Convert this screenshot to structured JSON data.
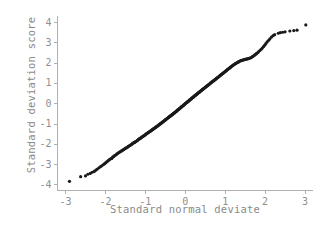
{
  "chart_data": {
    "type": "scatter",
    "title": "",
    "xlabel": "Standard normal deviate",
    "ylabel": "Standard deviation score",
    "xlim": [
      -3.2,
      3.2
    ],
    "ylim": [
      -4.3,
      4.3
    ],
    "xticks": [
      -3,
      -2,
      -1,
      0,
      1,
      2,
      3
    ],
    "xticklabels": [
      "-3",
      "-2",
      "-1",
      "0",
      "1",
      "2",
      "3"
    ],
    "yticks": [
      -4,
      -3,
      -2,
      -1,
      0,
      1,
      2,
      3,
      4
    ],
    "yticklabels": [
      "-4",
      "-3",
      "-2",
      "-1",
      "0",
      "1",
      "2",
      "3",
      "4"
    ],
    "grid": false,
    "legend": null,
    "marker": "point",
    "marker_color": "#1a1a1a",
    "marker_size": 1.6,
    "axis_color": "#b0b0b0",
    "text_color": "#8a8a8a",
    "background": "#ffffff",
    "spines": [
      "left",
      "bottom"
    ],
    "series": [
      {
        "name": "sd score vs normal deviate",
        "x": [
          -2.9,
          -2.62,
          -2.5,
          -2.44,
          -2.38,
          -2.33,
          -2.28,
          -2.24,
          -2.2,
          -2.16,
          -2.12,
          -2.09,
          -2.05,
          -2.02,
          -1.99,
          -1.96,
          -1.93,
          -1.9,
          -1.87,
          -1.84,
          -1.82,
          -1.79,
          -1.77,
          -1.74,
          -1.72,
          -1.69,
          -1.67,
          -1.65,
          -1.62,
          -1.6,
          -1.58,
          -1.56,
          -1.54,
          -1.52,
          -1.5,
          -1.48,
          -1.46,
          -1.44,
          -1.42,
          -1.4,
          -1.38,
          -1.36,
          -1.34,
          -1.33,
          -1.31,
          -1.29,
          -1.27,
          -1.26,
          -1.24,
          -1.22,
          -1.2,
          -1.19,
          -1.17,
          -1.15,
          -1.14,
          -1.12,
          -1.11,
          -1.09,
          -1.07,
          -1.06,
          -1.04,
          -1.03,
          -1.01,
          -1.0,
          -0.98,
          -0.97,
          -0.95,
          -0.94,
          -0.92,
          -0.91,
          -0.89,
          -0.88,
          -0.86,
          -0.85,
          -0.84,
          -0.82,
          -0.81,
          -0.79,
          -0.78,
          -0.77,
          -0.75,
          -0.74,
          -0.72,
          -0.71,
          -0.7,
          -0.68,
          -0.67,
          -0.66,
          -0.64,
          -0.63,
          -0.62,
          -0.6,
          -0.59,
          -0.58,
          -0.56,
          -0.55,
          -0.54,
          -0.52,
          -0.51,
          -0.5,
          -0.49,
          -0.47,
          -0.46,
          -0.45,
          -0.43,
          -0.42,
          -0.41,
          -0.4,
          -0.38,
          -0.37,
          -0.36,
          -0.35,
          -0.33,
          -0.32,
          -0.31,
          -0.3,
          -0.28,
          -0.27,
          -0.26,
          -0.25,
          -0.23,
          -0.22,
          -0.21,
          -0.2,
          -0.19,
          -0.17,
          -0.16,
          -0.15,
          -0.14,
          -0.12,
          -0.11,
          -0.1,
          -0.09,
          -0.08,
          -0.06,
          -0.05,
          -0.04,
          -0.03,
          -0.01,
          0.0,
          0.01,
          0.03,
          0.04,
          0.05,
          0.06,
          0.08,
          0.09,
          0.1,
          0.11,
          0.12,
          0.14,
          0.15,
          0.16,
          0.17,
          0.19,
          0.2,
          0.21,
          0.22,
          0.23,
          0.25,
          0.26,
          0.27,
          0.28,
          0.3,
          0.31,
          0.32,
          0.33,
          0.35,
          0.36,
          0.37,
          0.38,
          0.4,
          0.41,
          0.42,
          0.43,
          0.45,
          0.46,
          0.47,
          0.49,
          0.5,
          0.51,
          0.52,
          0.54,
          0.55,
          0.56,
          0.58,
          0.59,
          0.6,
          0.62,
          0.63,
          0.64,
          0.66,
          0.67,
          0.68,
          0.7,
          0.71,
          0.72,
          0.74,
          0.75,
          0.77,
          0.78,
          0.79,
          0.81,
          0.82,
          0.84,
          0.85,
          0.86,
          0.88,
          0.89,
          0.91,
          0.92,
          0.94,
          0.95,
          0.97,
          0.98,
          1.0,
          1.01,
          1.03,
          1.04,
          1.06,
          1.07,
          1.09,
          1.11,
          1.12,
          1.14,
          1.15,
          1.17,
          1.19,
          1.2,
          1.22,
          1.24,
          1.26,
          1.27,
          1.29,
          1.31,
          1.33,
          1.34,
          1.36,
          1.38,
          1.4,
          1.42,
          1.44,
          1.46,
          1.48,
          1.5,
          1.52,
          1.54,
          1.56,
          1.58,
          1.6,
          1.62,
          1.65,
          1.67,
          1.69,
          1.72,
          1.74,
          1.77,
          1.79,
          1.82,
          1.84,
          1.87,
          1.9,
          1.93,
          1.96,
          1.99,
          2.02,
          2.05,
          2.09,
          2.12,
          2.16,
          2.2,
          2.24,
          2.33,
          2.38,
          2.44,
          2.5,
          2.62,
          2.72,
          2.8,
          3.02
        ],
        "y": [
          -3.85,
          -3.62,
          -3.58,
          -3.5,
          -3.46,
          -3.4,
          -3.36,
          -3.3,
          -3.24,
          -3.18,
          -3.12,
          -3.08,
          -3.02,
          -2.98,
          -2.93,
          -2.88,
          -2.83,
          -2.78,
          -2.74,
          -2.72,
          -2.66,
          -2.62,
          -2.58,
          -2.55,
          -2.51,
          -2.47,
          -2.44,
          -2.41,
          -2.38,
          -2.35,
          -2.33,
          -2.3,
          -2.28,
          -2.25,
          -2.22,
          -2.2,
          -2.18,
          -2.15,
          -2.12,
          -2.1,
          -2.07,
          -2.05,
          -2.02,
          -2.0,
          -1.97,
          -1.95,
          -1.93,
          -1.91,
          -1.89,
          -1.86,
          -1.84,
          -1.81,
          -1.78,
          -1.76,
          -1.74,
          -1.72,
          -1.7,
          -1.67,
          -1.65,
          -1.63,
          -1.61,
          -1.59,
          -1.57,
          -1.55,
          -1.52,
          -1.5,
          -1.48,
          -1.46,
          -1.44,
          -1.42,
          -1.4,
          -1.38,
          -1.36,
          -1.34,
          -1.32,
          -1.3,
          -1.28,
          -1.26,
          -1.24,
          -1.22,
          -1.2,
          -1.18,
          -1.16,
          -1.14,
          -1.12,
          -1.1,
          -1.08,
          -1.06,
          -1.04,
          -1.02,
          -1.0,
          -0.98,
          -0.96,
          -0.94,
          -0.92,
          -0.9,
          -0.88,
          -0.86,
          -0.84,
          -0.82,
          -0.8,
          -0.78,
          -0.76,
          -0.74,
          -0.72,
          -0.7,
          -0.68,
          -0.66,
          -0.64,
          -0.62,
          -0.61,
          -0.59,
          -0.57,
          -0.55,
          -0.53,
          -0.51,
          -0.49,
          -0.47,
          -0.45,
          -0.43,
          -0.41,
          -0.39,
          -0.37,
          -0.35,
          -0.33,
          -0.31,
          -0.29,
          -0.27,
          -0.25,
          -0.23,
          -0.21,
          -0.19,
          -0.17,
          -0.15,
          -0.13,
          -0.11,
          -0.09,
          -0.07,
          -0.04,
          -0.02,
          0.0,
          0.02,
          0.04,
          0.06,
          0.08,
          0.1,
          0.12,
          0.14,
          0.16,
          0.18,
          0.2,
          0.22,
          0.24,
          0.26,
          0.28,
          0.3,
          0.32,
          0.34,
          0.36,
          0.38,
          0.4,
          0.42,
          0.44,
          0.46,
          0.48,
          0.5,
          0.52,
          0.54,
          0.56,
          0.58,
          0.6,
          0.62,
          0.64,
          0.66,
          0.68,
          0.7,
          0.72,
          0.74,
          0.76,
          0.78,
          0.8,
          0.82,
          0.84,
          0.86,
          0.88,
          0.9,
          0.92,
          0.94,
          0.96,
          0.99,
          1.01,
          1.03,
          1.05,
          1.07,
          1.09,
          1.11,
          1.13,
          1.15,
          1.17,
          1.2,
          1.22,
          1.24,
          1.26,
          1.28,
          1.31,
          1.33,
          1.35,
          1.37,
          1.4,
          1.42,
          1.44,
          1.47,
          1.49,
          1.51,
          1.54,
          1.56,
          1.58,
          1.61,
          1.63,
          1.66,
          1.68,
          1.71,
          1.73,
          1.76,
          1.78,
          1.81,
          1.83,
          1.86,
          1.88,
          1.9,
          1.93,
          1.95,
          1.97,
          1.99,
          2.01,
          2.03,
          2.05,
          2.07,
          2.09,
          2.1,
          2.12,
          2.13,
          2.14,
          2.15,
          2.16,
          2.17,
          2.18,
          2.19,
          2.2,
          2.21,
          2.23,
          2.25,
          2.28,
          2.31,
          2.34,
          2.38,
          2.42,
          2.46,
          2.5,
          2.55,
          2.6,
          2.66,
          2.72,
          2.79,
          2.86,
          2.94,
          3.02,
          3.1,
          3.18,
          3.26,
          3.33,
          3.38,
          3.45,
          3.48,
          3.5,
          3.52,
          3.56,
          3.58,
          3.6,
          3.86
        ]
      }
    ]
  }
}
